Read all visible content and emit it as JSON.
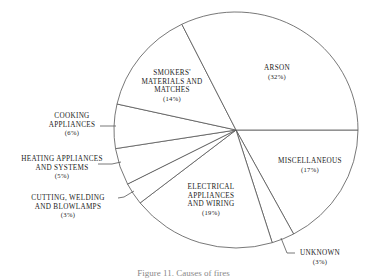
{
  "chart_data": {
    "type": "pie",
    "title": "",
    "start_angle_deg": 0,
    "direction": "clockwise",
    "slices": [
      {
        "name": "MISCELLANEOUS",
        "lines": [
          "MISCELLANEOUS"
        ],
        "value": 17,
        "pct_label": "(17%)"
      },
      {
        "name": "UNKNOWN",
        "lines": [
          "UNKNOWN"
        ],
        "value": 3,
        "pct_label": "(3%)"
      },
      {
        "name": "ELECTRICAL APPLIANCES AND WIRING",
        "lines": [
          "ELECTRICAL",
          "APPLIANCES",
          "AND WIRING"
        ],
        "value": 19,
        "pct_label": "(19%)"
      },
      {
        "name": "CUTTING, WELDING AND BLOWLAMPS",
        "lines": [
          "CUTTING, WELDING",
          "AND BLOWLAMPS"
        ],
        "value": 3,
        "pct_label": "(3%)"
      },
      {
        "name": "HEATING APPLIANCES AND SYSTEMS",
        "lines": [
          "HEATING APPLIANCES",
          "AND SYSTEMS"
        ],
        "value": 5,
        "pct_label": "(5%)"
      },
      {
        "name": "COOKING APPLIANCES",
        "lines": [
          "COOKING",
          "APPLIANCES"
        ],
        "value": 6,
        "pct_label": "(6%)"
      },
      {
        "name": "SMOKERS' MATERIALS AND MATCHES",
        "lines": [
          "SMOKERS'",
          "MATERIALS AND",
          "MATCHES"
        ],
        "value": 14,
        "pct_label": "(14%)"
      },
      {
        "name": "ARSON",
        "lines": [
          "ARSON"
        ],
        "value": 32,
        "pct_label": "(32%)"
      }
    ],
    "categories": [
      "MISCELLANEOUS",
      "UNKNOWN",
      "ELECTRICAL APPLIANCES AND WIRING",
      "CUTTING, WELDING AND BLOWLAMPS",
      "HEATING APPLIANCES AND SYSTEMS",
      "COOKING APPLIANCES",
      "SMOKERS' MATERIALS AND MATCHES",
      "ARSON"
    ],
    "values": [
      17,
      3,
      19,
      3,
      5,
      6,
      14,
      32
    ],
    "units": "%",
    "legend": "none (labels inside/with leader lines)",
    "colors": {
      "fill": "#ffffff",
      "stroke": "#555555",
      "text": "#222222"
    }
  },
  "caption": {
    "text": "Figure 11. Causes of fires",
    "partially_visible": true
  }
}
